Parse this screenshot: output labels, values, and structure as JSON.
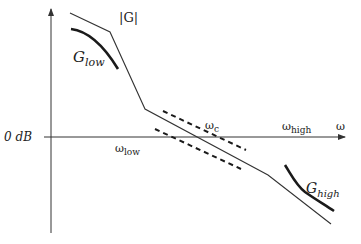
{
  "diagram": {
    "type": "bode-magnitude-loop-shaping",
    "axes": {
      "y_axis_label": "",
      "x_axis_label": "ω",
      "zero_line_label": "0 dB"
    },
    "labels": {
      "open_loop_gain": "|G|",
      "low_bound_main": "G",
      "low_bound_sub": "low",
      "high_bound_main": "G",
      "high_bound_sub": "high",
      "omega_low_main": "ω",
      "omega_low_sub": "low",
      "omega_c_main": "ω",
      "omega_c_sub": "c",
      "omega_high_main": "ω",
      "omega_high_sub": "high"
    },
    "colors": {
      "line": "#333333",
      "thick": "#1a1a1a",
      "background": "#ffffff"
    }
  }
}
